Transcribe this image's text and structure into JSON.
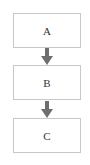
{
  "diagram": {
    "type": "flowchart",
    "direction": "top-to-bottom",
    "nodes": [
      {
        "id": "A",
        "label": "A"
      },
      {
        "id": "B",
        "label": "B"
      },
      {
        "id": "C",
        "label": "C"
      }
    ],
    "edges": [
      {
        "from": "A",
        "to": "B"
      },
      {
        "from": "B",
        "to": "C"
      }
    ],
    "colors": {
      "box_border": "#c8c8c8",
      "arrow": "#6e6e6e",
      "text": "#333333"
    }
  }
}
